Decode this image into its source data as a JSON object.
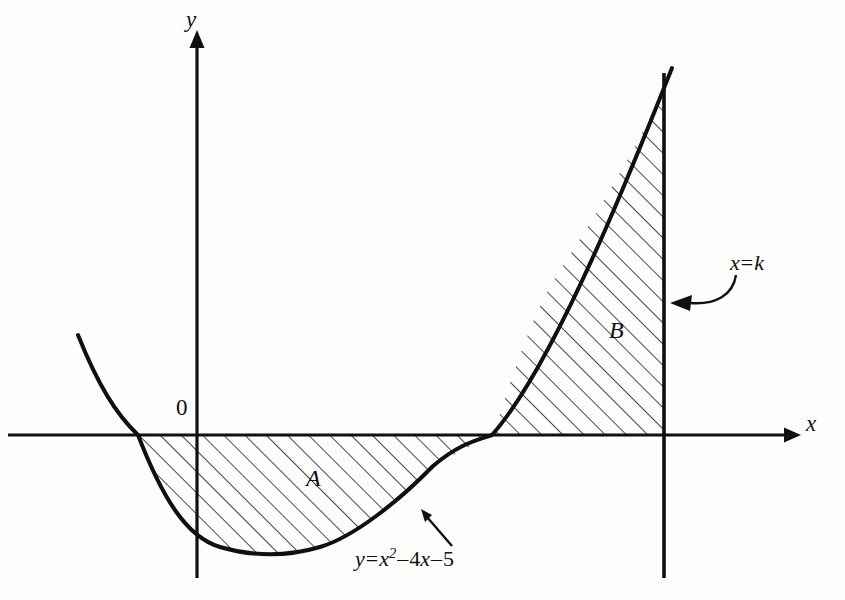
{
  "figure": {
    "kind": "coordinate-diagram",
    "background_color": "#fdfdfc",
    "ink_color": "#101010",
    "hatch_color": "#1a1a1a"
  },
  "axes": {
    "x_label": "x",
    "y_label": "y",
    "origin_label": "0",
    "x_axis_pixel_y": 435,
    "y_axis_pixel_x": 197,
    "x_axis_start_x": 8,
    "x_axis_end_x": 795,
    "y_axis_top_y": 40,
    "y_axis_bottom_y": 578,
    "pixels_per_unit": 59
  },
  "curve": {
    "equation_parts": {
      "lhs": "y",
      "equals": "=",
      "term1_base": "x",
      "term1_exponent": "2",
      "minus1": "–",
      "term2": "4",
      "term2_var": "x",
      "minus2": "–",
      "term3": "5"
    },
    "equation_plain": "y = x² – 4x – 5",
    "roots": [
      -1,
      5
    ],
    "vertex": [
      2,
      -9
    ],
    "leading_coefficient": 1,
    "domain_drawn": [
      -2.05,
      8.05
    ]
  },
  "vertical_line": {
    "label_parts": {
      "var": "x",
      "equals": "=",
      "value": "k"
    },
    "label_plain": "x = k",
    "pixel_x": 664,
    "top_y": 73,
    "bottom_y": 578
  },
  "regions": [
    {
      "id": "A",
      "label": "A",
      "label_pixel": [
        306,
        466
      ],
      "bounds": "between the curve and the x-axis from x = -1 to x = 5",
      "hatch": "diagonal-45"
    },
    {
      "id": "B",
      "label": "B",
      "label_pixel": [
        609,
        318
      ],
      "bounds": "between the curve, the x-axis and the line x = k from x = 5 to x = k",
      "hatch": "diagonal-45"
    }
  ],
  "annotations": [
    {
      "name": "equation-pointer",
      "kind": "straight-arrow",
      "from": [
        452,
        545
      ],
      "to": [
        423,
        511
      ]
    },
    {
      "name": "xk-pointer",
      "kind": "curved-arrow",
      "from": [
        726,
        272
      ],
      "to": [
        672,
        303
      ]
    }
  ]
}
